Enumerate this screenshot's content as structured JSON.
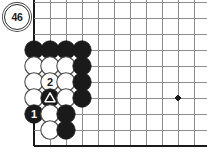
{
  "figure": {
    "kind": "go-board-diagram",
    "label": {
      "text": "46",
      "shape": "circle",
      "x": 17,
      "y": 17,
      "radius": 13
    },
    "board": {
      "background_color": "#ffffff",
      "line_color": "#8c8c8c",
      "edge_color": "#1a1a1a",
      "origin_x": 34,
      "origin_y": 2,
      "spacing": 16,
      "cols": 11,
      "rows": 10,
      "left_edge_col": 0,
      "bottom_edge_row": 9,
      "star_points": [
        {
          "col": 9,
          "row": 6
        }
      ]
    },
    "stones": [
      {
        "col": 0,
        "row": 3,
        "color": "black",
        "label": "",
        "marker": ""
      },
      {
        "col": 1,
        "row": 3,
        "color": "black",
        "label": "",
        "marker": ""
      },
      {
        "col": 2,
        "row": 3,
        "color": "black",
        "label": "",
        "marker": ""
      },
      {
        "col": 3,
        "row": 3,
        "color": "black",
        "label": "",
        "marker": ""
      },
      {
        "col": 0,
        "row": 4,
        "color": "white",
        "label": "",
        "marker": ""
      },
      {
        "col": 1,
        "row": 4,
        "color": "white",
        "label": "",
        "marker": ""
      },
      {
        "col": 2,
        "row": 4,
        "color": "white",
        "label": "",
        "marker": ""
      },
      {
        "col": 3,
        "row": 4,
        "color": "black",
        "label": "",
        "marker": ""
      },
      {
        "col": 0,
        "row": 5,
        "color": "white",
        "label": "",
        "marker": ""
      },
      {
        "col": 1,
        "row": 5,
        "color": "white",
        "label": "2",
        "marker": ""
      },
      {
        "col": 2,
        "row": 5,
        "color": "white",
        "label": "",
        "marker": ""
      },
      {
        "col": 3,
        "row": 5,
        "color": "black",
        "label": "",
        "marker": ""
      },
      {
        "col": 0,
        "row": 6,
        "color": "white",
        "label": "",
        "marker": ""
      },
      {
        "col": 1,
        "row": 6,
        "color": "black",
        "label": "",
        "marker": "triangle"
      },
      {
        "col": 2,
        "row": 6,
        "color": "white",
        "label": "",
        "marker": ""
      },
      {
        "col": 3,
        "row": 6,
        "color": "black",
        "label": "",
        "marker": ""
      },
      {
        "col": 0,
        "row": 7,
        "color": "black",
        "label": "1",
        "marker": ""
      },
      {
        "col": 1,
        "row": 7,
        "color": "white",
        "label": "",
        "marker": ""
      },
      {
        "col": 2,
        "row": 7,
        "color": "black",
        "label": "",
        "marker": ""
      },
      {
        "col": 1,
        "row": 8,
        "color": "white",
        "label": "",
        "marker": ""
      },
      {
        "col": 2,
        "row": 8,
        "color": "black",
        "label": "",
        "marker": ""
      }
    ],
    "stone_style": {
      "radius": 9.2,
      "black_fill": "#1a1a1a",
      "white_fill": "#ffffff",
      "white_stroke": "#4a4a4a",
      "black_label_color": "#ffffff",
      "white_label_color": "#1a1a1a",
      "triangle_color": "#ffffff"
    }
  }
}
